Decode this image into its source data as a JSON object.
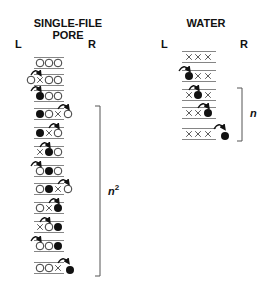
{
  "single_file": {
    "title_line1": "SINGLE-FILE",
    "title_line2": "PORE",
    "left_label": "L",
    "right_label": "R",
    "bracket_label": "n",
    "bracket_sup": "2",
    "legend": {
      "open_circle": "water molecule",
      "filled_circle": "tracer water molecule",
      "x": "vacancy"
    },
    "rows": [
      {
        "sites": [
          "o",
          "o",
          "o"
        ],
        "outside_left": null,
        "outside_right": null,
        "arrow": null
      },
      {
        "sites": [
          "x",
          "o",
          "o"
        ],
        "outside_left": "o",
        "outside_right": null,
        "arrow": "enter-left"
      },
      {
        "sites": [
          "f",
          "o",
          "o"
        ],
        "outside_left": null,
        "outside_right": null,
        "arrow": "enter-left"
      },
      {
        "sites": [
          "f",
          "o",
          "x"
        ],
        "outside_left": null,
        "outside_right": "o",
        "arrow": "exit-right"
      },
      {
        "sites": [
          "f",
          "x",
          "o"
        ],
        "outside_left": null,
        "outside_right": null,
        "arrow": "2-3"
      },
      {
        "sites": [
          "x",
          "f",
          "o"
        ],
        "outside_left": null,
        "outside_right": null,
        "arrow": "1-2"
      },
      {
        "sites": [
          "o",
          "f",
          "o"
        ],
        "outside_left": null,
        "outside_right": null,
        "arrow": "enter-left"
      },
      {
        "sites": [
          "o",
          "f",
          "x"
        ],
        "outside_left": null,
        "outside_right": "o",
        "arrow": "exit-right"
      },
      {
        "sites": [
          "o",
          "x",
          "f"
        ],
        "outside_left": null,
        "outside_right": null,
        "arrow": "2-3"
      },
      {
        "sites": [
          "x",
          "o",
          "f"
        ],
        "outside_left": null,
        "outside_right": null,
        "arrow": "1-2"
      },
      {
        "sites": [
          "o",
          "o",
          "f"
        ],
        "outside_left": null,
        "outside_right": null,
        "arrow": "enter-left"
      },
      {
        "sites": [
          "o",
          "o",
          "x"
        ],
        "outside_left": null,
        "outside_right": "f",
        "arrow": "exit-right"
      }
    ]
  },
  "water": {
    "title": "WATER",
    "left_label": "L",
    "right_label": "R",
    "bracket_label": "n",
    "rows": [
      {
        "sites": [
          "x",
          "x",
          "x"
        ],
        "outside_right": null,
        "arrow": null
      },
      {
        "sites": [
          "f",
          "x",
          "x"
        ],
        "outside_right": null,
        "arrow": "enter-left"
      },
      {
        "sites": [
          "x",
          "f",
          "x"
        ],
        "outside_right": null,
        "arrow": "1-2"
      },
      {
        "sites": [
          "x",
          "x",
          "f"
        ],
        "outside_right": null,
        "arrow": "2-3"
      },
      {
        "sites": [
          "x",
          "x",
          "x"
        ],
        "outside_right": "f",
        "arrow": "exit-right"
      }
    ]
  }
}
